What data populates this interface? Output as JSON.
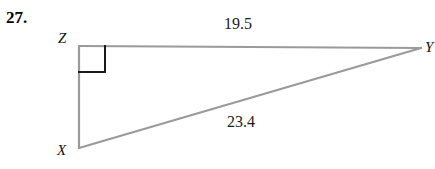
{
  "problem": {
    "number_label": "27."
  },
  "figure": {
    "type": "right-triangle-diagram",
    "vertices": [
      {
        "name": "Z",
        "label": "Z",
        "x": 79,
        "y": 46,
        "right_angle": true
      },
      {
        "name": "Y",
        "label": "Y",
        "x": 421,
        "y": 48,
        "right_angle": false
      },
      {
        "name": "X",
        "label": "X",
        "x": 79,
        "y": 148,
        "right_angle": false
      }
    ],
    "sides": [
      {
        "name": "ZY",
        "label": "19.5",
        "value": 19.5,
        "from": "Z",
        "to": "Y",
        "position": "top"
      },
      {
        "name": "XY",
        "label": "23.4",
        "value": 23.4,
        "from": "X",
        "to": "Y",
        "position": "hypotenuse"
      },
      {
        "name": "XZ",
        "label": "",
        "value": null,
        "from": "X",
        "to": "Z",
        "position": "left-leg"
      }
    ],
    "right_angle_marker": {
      "at_vertex": "Z",
      "size": 26,
      "color": "#1a1a1a"
    },
    "colors": {
      "background": "#ffffff",
      "triangle_stroke": "#9a9a9a",
      "right_angle_stroke": "#1a1a1a",
      "text": "#111111",
      "number_label": "#000000"
    }
  }
}
